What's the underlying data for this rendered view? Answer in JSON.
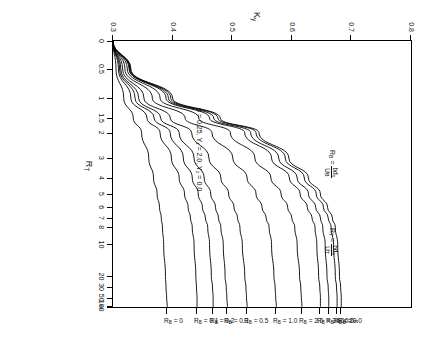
{
  "figure": {
    "rotation_note": "figure printed sideways (rotated 90 degrees)",
    "x_axis": {
      "title": "R_T",
      "scale": "log-like compressed",
      "tick_labels": [
        "0",
        "0.5",
        "1",
        "1.5",
        "2",
        "3",
        "4",
        "5",
        "6",
        "7",
        "8",
        "10",
        "20",
        "30",
        "50",
        "100",
        "∞"
      ]
    },
    "y_axis": {
      "title": "K",
      "title_sub": "y",
      "tick_labels": [
        "0.3",
        "0.4",
        "0.5",
        "0.6",
        "0.7",
        "0.8"
      ],
      "range": [
        0.3,
        0.8
      ]
    },
    "annotations": [
      {
        "id": "params",
        "text": "β = 0.25,  Y₁ = 2.0,  Y₂ = 0.0"
      },
      {
        "id": "rb-def-lhs",
        "text": "R",
        "sub": "B",
        "eq": "=",
        "num": "bd₀",
        "den": "Uʙ"
      },
      {
        "id": "rt-def-lhs",
        "text": "R",
        "sub": "T",
        "eq": "=",
        "num": "bd₀",
        "den": "Uᴛ"
      }
    ],
    "curve_labels": [
      {
        "label": "R",
        "sub": "B",
        "eq": "=",
        "value": "∞"
      },
      {
        "label": "R",
        "sub": "B",
        "eq": "=",
        "value": "20.0"
      },
      {
        "label": "R",
        "sub": "B",
        "eq": "=",
        "value": "10.0"
      },
      {
        "label": "R",
        "sub": "B",
        "eq": "=",
        "value": "3.0"
      },
      {
        "label": "R",
        "sub": "B",
        "eq": "=",
        "value": "2.0"
      },
      {
        "label": "R",
        "sub": "B",
        "eq": "=",
        "value": "1.0"
      },
      {
        "label": "R",
        "sub": "B",
        "eq": "=",
        "value": "0.5"
      },
      {
        "label": "R",
        "sub": "B",
        "eq": "=",
        "value": "0.3"
      },
      {
        "label": "R",
        "sub": "B",
        "eq": "=",
        "value": "0.2"
      },
      {
        "label": "R",
        "sub": "B",
        "eq": "=",
        "value": "0.1"
      },
      {
        "label": "R",
        "sub": "B",
        "eq": "=",
        "value": "0"
      }
    ]
  },
  "chart_data": {
    "type": "line",
    "title": "",
    "xlabel": "R_T",
    "ylabel": "K_y",
    "xscale": "log",
    "x_tick_labels": [
      "0",
      "0.5",
      "1",
      "1.5",
      "2",
      "3",
      "4",
      "5",
      "6",
      "7",
      "8",
      "10",
      "20",
      "30",
      "50",
      "100",
      "∞"
    ],
    "x_tick_positions": [
      0.0,
      0.105,
      0.215,
      0.29,
      0.345,
      0.44,
      0.515,
      0.575,
      0.625,
      0.665,
      0.7,
      0.765,
      0.885,
      0.925,
      0.965,
      0.995,
      1.0
    ],
    "ylim": [
      0.3,
      0.8
    ],
    "y_tick_labels": [
      "0.3",
      "0.4",
      "0.5",
      "0.6",
      "0.7",
      "0.8"
    ],
    "grid": false,
    "legend": "inline-curve-labels",
    "legend_position": "top (along infinity edge)",
    "parameters": {
      "beta": 0.25,
      "Y1": 2.0,
      "Y2": 0.0
    },
    "definitions": {
      "R_B": "bd0 / U_B",
      "R_T": "bd0 / U_T"
    },
    "series": [
      {
        "name": "R_B = ∞",
        "asymptote": 0.683,
        "start": 0.3,
        "values": [
          0.3,
          0.33,
          0.4,
          0.48,
          0.545,
          0.595,
          0.628,
          0.648,
          0.66,
          0.668,
          0.673,
          0.677,
          0.68,
          0.682,
          0.683,
          0.683,
          0.683
        ]
      },
      {
        "name": "R_B = 20.0",
        "asymptote": 0.676,
        "start": 0.3,
        "values": [
          0.3,
          0.329,
          0.397,
          0.476,
          0.54,
          0.589,
          0.621,
          0.641,
          0.653,
          0.661,
          0.666,
          0.67,
          0.673,
          0.675,
          0.676,
          0.676,
          0.676
        ]
      },
      {
        "name": "R_B = 10.0",
        "asymptote": 0.662,
        "start": 0.3,
        "values": [
          0.3,
          0.328,
          0.393,
          0.469,
          0.531,
          0.578,
          0.609,
          0.628,
          0.64,
          0.648,
          0.652,
          0.656,
          0.659,
          0.661,
          0.662,
          0.662,
          0.662
        ]
      },
      {
        "name": "R_B = 3.0",
        "asymptote": 0.648,
        "start": 0.3,
        "values": [
          0.3,
          0.327,
          0.389,
          0.462,
          0.521,
          0.566,
          0.596,
          0.614,
          0.626,
          0.634,
          0.639,
          0.642,
          0.645,
          0.647,
          0.648,
          0.648,
          0.648
        ]
      },
      {
        "name": "R_B = 2.0",
        "asymptote": 0.617,
        "start": 0.3,
        "values": [
          0.3,
          0.324,
          0.379,
          0.444,
          0.497,
          0.538,
          0.565,
          0.582,
          0.593,
          0.6,
          0.605,
          0.609,
          0.613,
          0.615,
          0.616,
          0.617,
          0.617
        ]
      },
      {
        "name": "R_B = 1.0",
        "asymptote": 0.574,
        "start": 0.3,
        "values": [
          0.3,
          0.32,
          0.366,
          0.421,
          0.466,
          0.501,
          0.525,
          0.54,
          0.55,
          0.557,
          0.562,
          0.566,
          0.57,
          0.572,
          0.573,
          0.574,
          0.574
        ]
      },
      {
        "name": "R_B = 0.5",
        "asymptote": 0.525,
        "start": 0.3,
        "values": [
          0.3,
          0.316,
          0.352,
          0.396,
          0.432,
          0.461,
          0.481,
          0.494,
          0.503,
          0.509,
          0.513,
          0.517,
          0.521,
          0.523,
          0.524,
          0.525,
          0.525
        ]
      },
      {
        "name": "R_B = 0.3",
        "asymptote": 0.492,
        "start": 0.3,
        "values": [
          0.3,
          0.313,
          0.343,
          0.38,
          0.411,
          0.436,
          0.453,
          0.464,
          0.472,
          0.477,
          0.481,
          0.485,
          0.488,
          0.49,
          0.491,
          0.492,
          0.492
        ]
      },
      {
        "name": "R_B = 0.2",
        "asymptote": 0.468,
        "start": 0.3,
        "values": [
          0.3,
          0.311,
          0.337,
          0.369,
          0.396,
          0.418,
          0.433,
          0.443,
          0.45,
          0.455,
          0.459,
          0.462,
          0.465,
          0.467,
          0.468,
          0.468,
          0.468
        ]
      },
      {
        "name": "R_B = 0.1",
        "asymptote": 0.441,
        "start": 0.3,
        "values": [
          0.3,
          0.309,
          0.33,
          0.357,
          0.379,
          0.398,
          0.411,
          0.42,
          0.426,
          0.43,
          0.433,
          0.436,
          0.439,
          0.44,
          0.441,
          0.441,
          0.441
        ]
      },
      {
        "name": "R_B = 0",
        "asymptote": 0.391,
        "start": 0.3,
        "values": [
          0.3,
          0.305,
          0.318,
          0.334,
          0.348,
          0.36,
          0.368,
          0.374,
          0.378,
          0.381,
          0.383,
          0.385,
          0.388,
          0.389,
          0.39,
          0.391,
          0.391
        ]
      }
    ]
  }
}
